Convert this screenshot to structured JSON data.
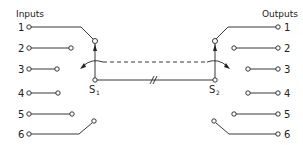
{
  "diagram": {
    "type": "two-rotary-switch ganged selector (6 inputs to 6 outputs)",
    "inputs_label": "Inputs",
    "outputs_label": "Outputs",
    "inputs": [
      "1",
      "2",
      "3",
      "4",
      "5",
      "6"
    ],
    "outputs": [
      "1",
      "2",
      "3",
      "4",
      "5",
      "6"
    ],
    "switches": [
      {
        "name": "S",
        "subscript": "1",
        "connected_to": "input 1"
      },
      {
        "name": "S",
        "subscript": "2",
        "connected_to": "output 1"
      }
    ],
    "link": {
      "mechanical_coupling": "dashed line",
      "electrical": "solid line with break mark",
      "break_mark": "//"
    },
    "colors": {
      "line": "#222222",
      "background": "#ffffff"
    }
  }
}
